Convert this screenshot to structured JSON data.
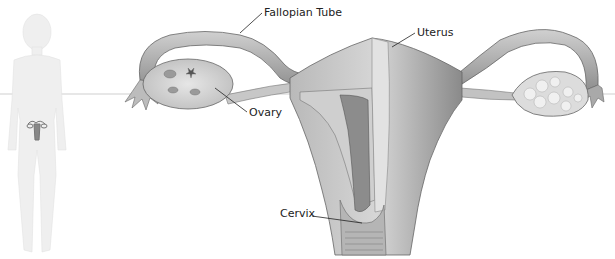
{
  "diagram": {
    "labels": {
      "fallopian_tube": "Fallopian Tube",
      "uterus": "Uterus",
      "ovary": "Ovary",
      "cervix": "Cervix"
    },
    "locator_figure": "female-body-silhouette",
    "colors": {
      "background": "#ffffff",
      "tissue_light": "#d9d9d9",
      "tissue_mid": "#a8a8a8",
      "tissue_dark": "#6e6e6e",
      "outline": "#555555",
      "silhouette": "#eeeeee",
      "guide_line": "#cfcfcf",
      "text": "#222222"
    }
  }
}
